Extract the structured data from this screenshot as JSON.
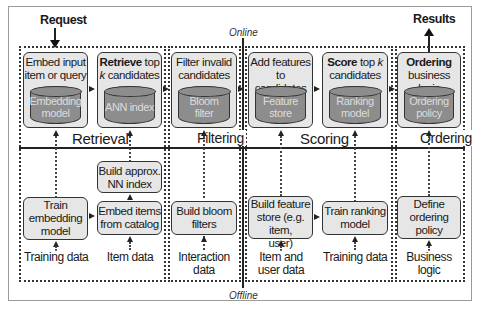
{
  "header": {
    "request_label": "Request",
    "results_label": "Results",
    "online_label": "Online",
    "offline_label": "Offline"
  },
  "stages": [
    {
      "id": "retrieval",
      "label": "Retrieval"
    },
    {
      "id": "filtering",
      "label": "Filtering"
    },
    {
      "id": "scoring",
      "label": "Scoring"
    },
    {
      "id": "ordering",
      "label": "Ordering"
    }
  ],
  "online": {
    "embed_input": {
      "line1": "Embed input",
      "line2": "item or query",
      "store_line1": "Embedding",
      "store_line2": "model"
    },
    "retrieve": {
      "bold": "Retrieve",
      "rest1": " top",
      "k": "k",
      "rest2": " candidates",
      "store_line1": "ANN index",
      "store_line2": ""
    },
    "filter": {
      "line1": "Filter invalid",
      "line2": "candidates",
      "store_line1": "Bloom filter",
      "store_line2": ""
    },
    "add_features": {
      "line1": "Add features",
      "line2": "to candidates",
      "store_line1": "Feature",
      "store_line2": "store"
    },
    "score": {
      "bold": "Score",
      "rest1": " top ",
      "k": "k",
      "line2": "candidates",
      "store_line1": "Ranking",
      "store_line2": "model"
    },
    "ordering": {
      "bold": "Ordering",
      "line2": "business logic",
      "store_line1": "Ordering",
      "store_line2": "policy"
    }
  },
  "offline": {
    "train_embedding": {
      "line1": "Train",
      "line2": "embedding",
      "line3": "model"
    },
    "build_ann": {
      "line1": "Build approx.",
      "line2": "NN index"
    },
    "embed_items": {
      "line1": "Embed items",
      "line2": "from catalog"
    },
    "build_bloom": {
      "line1": "Build bloom",
      "line2": "filters"
    },
    "build_feature_store": {
      "line1": "Build feature",
      "line2": "store (e.g. item,",
      "line3": "user)"
    },
    "train_ranking": {
      "line1": "Train ranking",
      "line2": "model"
    },
    "define_ordering": {
      "line1": "Define",
      "line2": "ordering",
      "line3": "policy"
    }
  },
  "inputs": [
    {
      "line1": "Training data",
      "line2": ""
    },
    {
      "line1": "Item data",
      "line2": ""
    },
    {
      "line1": "Interaction",
      "line2": "data"
    },
    {
      "line1": "Item and",
      "line2": "user data"
    },
    {
      "line1": "Training data",
      "line2": ""
    },
    {
      "line1": "Business",
      "line2": "logic"
    }
  ],
  "colors": {
    "box_fill": "#e6e6e6",
    "store_fill": "#8d8d8d",
    "store_text": "#dcdcdc",
    "line": "#222222"
  }
}
